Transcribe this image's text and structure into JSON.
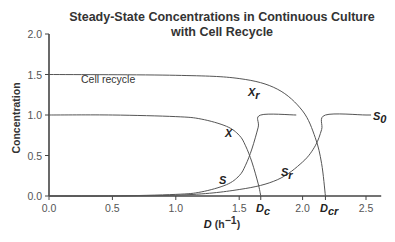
{
  "chart_data": {
    "type": "line",
    "title": "Steady-State Concentrations in Continuous Culture",
    "subtitle": "with Cell Recycle",
    "xlabel": "D (h⁻¹)",
    "xlabel_main": "D",
    "xlabel_unit": " (h⁻¹)",
    "ylabel": "Concentration",
    "xlim": [
      0,
      2.6
    ],
    "ylim": [
      0,
      2.0
    ],
    "xticks": [
      "0.0",
      "0.5",
      "1.0",
      "1.5",
      "2.0",
      "2.5"
    ],
    "xtick_values": [
      0,
      0.5,
      1.0,
      1.5,
      2.0,
      2.5
    ],
    "yticks": [
      "0.0",
      "0.5",
      "1.0",
      "1.5",
      "2.0"
    ],
    "ytick_values": [
      0,
      0.5,
      1.0,
      1.5,
      2.0
    ],
    "grid": false,
    "annotations": [
      {
        "text": "Cell recycle",
        "x": 0.25,
        "y": 1.42
      },
      {
        "text": "D_c",
        "x": 1.67,
        "y": 0
      },
      {
        "text": "D_cr",
        "x": 2.18,
        "y": 0
      },
      {
        "text": "S_0",
        "x": 2.5,
        "y": 1.0
      }
    ],
    "series": [
      {
        "name": "X",
        "x": [
          0,
          0.5,
          1.0,
          1.2,
          1.4,
          1.5,
          1.55,
          1.6,
          1.65,
          1.67
        ],
        "values": [
          1.0,
          1.0,
          0.98,
          0.95,
          0.86,
          0.75,
          0.62,
          0.42,
          0.15,
          0.0
        ]
      },
      {
        "name": "S",
        "x": [
          0,
          0.5,
          1.0,
          1.2,
          1.4,
          1.5,
          1.55,
          1.6,
          1.65,
          1.67,
          1.95
        ],
        "values": [
          0.0,
          0.0,
          0.02,
          0.05,
          0.14,
          0.25,
          0.38,
          0.58,
          0.85,
          1.0,
          1.0
        ]
      },
      {
        "name": "X_r",
        "x": [
          0,
          1.0,
          1.5,
          1.8,
          2.0,
          2.1,
          2.15,
          2.18
        ],
        "values": [
          1.5,
          1.49,
          1.45,
          1.32,
          1.05,
          0.72,
          0.4,
          0.0
        ]
      },
      {
        "name": "S_r",
        "x": [
          0,
          1.0,
          1.5,
          1.8,
          2.0,
          2.1,
          2.15,
          2.18,
          2.5
        ],
        "values": [
          0.0,
          0.01,
          0.08,
          0.2,
          0.42,
          0.62,
          0.82,
          1.0,
          1.0
        ]
      }
    ],
    "series_labels": [
      {
        "name": "X",
        "x": 1.42,
        "y": 0.78
      },
      {
        "name": "S",
        "x": 1.38,
        "y": 0.2
      },
      {
        "name": "X_r",
        "x": 1.58,
        "y": 1.24
      },
      {
        "name": "S_r",
        "x": 1.85,
        "y": 0.3
      }
    ]
  },
  "labels": {
    "title_line1": "Steady-State Concentrations in Continuous Culture",
    "title_line2": "with Cell Recycle",
    "ylabel": "Concentration",
    "xlabel_main": "D",
    "xlabel_unit": " (h",
    "xlabel_sup": "−1",
    "xlabel_close": ")",
    "cell_recycle": "Cell recycle",
    "X": "X",
    "S": "S",
    "Xr_main": "X",
    "Xr_sub": "r",
    "Sr_main": "S",
    "Sr_sub": "r",
    "S0_main": "S",
    "S0_sub": "0",
    "Dc_main": "D",
    "Dc_sub": "c",
    "Dcr_main": "D",
    "Dcr_sub": "cr"
  }
}
